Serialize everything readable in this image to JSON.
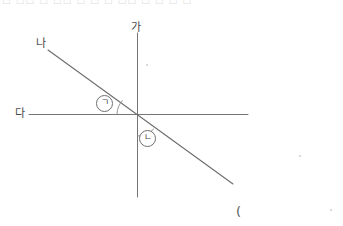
{
  "figure": {
    "title_strip": "□ □□ □ □□ □ □ □ □□ □ □ □ □",
    "stray_paren": "(",
    "labels": {
      "vertical_line": "가",
      "diagonal_line": "나",
      "horizontal_line": "다",
      "angle_upper_left": "㉠",
      "angle_lower_right": "㉡"
    },
    "geometry": {
      "intersection": {
        "x": 138,
        "y": 114
      },
      "lines": [
        {
          "name": "vertical-line-ga",
          "label": "가",
          "x1": 137,
          "y1": 33,
          "x2": 137,
          "y2": 197
        },
        {
          "name": "horizontal-line-da",
          "label": "다",
          "x1": 29,
          "y1": 114,
          "x2": 248,
          "y2": 114
        },
        {
          "name": "diagonal-line-na",
          "label": "나",
          "x1": 48,
          "y1": 50,
          "x2": 233,
          "y2": 184
        }
      ],
      "angle_arcs": [
        {
          "name": "arc-giyeok",
          "between": [
            "diagonal-line-na",
            "horizontal-line-da"
          ],
          "side": "upper-left"
        },
        {
          "name": "arc-nieun",
          "between": [
            "vertical-line-ga",
            "diagonal-line-na"
          ],
          "side": "lower-right"
        }
      ]
    },
    "colors": {
      "ink": "#6f6f6f",
      "label_ink": "#4a4a4a",
      "background": "#ffffff",
      "faint_strip": "#d8d8d8"
    }
  }
}
